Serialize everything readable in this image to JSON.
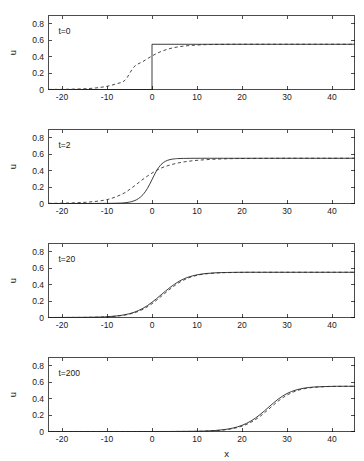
{
  "figure": {
    "width": 364,
    "height": 461,
    "background": "#ffffff",
    "ink_color": "#1b1b1b",
    "xlabel": "x",
    "ylabel": "u"
  },
  "chart_data": {
    "type": "line",
    "title": "",
    "subtitle": "",
    "xlabel": "x",
    "ylabel": "u",
    "grid": false,
    "legend": "none",
    "panel_layout": "4 rows x 1 column, shared x axis",
    "xlim": [
      -23,
      45
    ],
    "ylim": [
      0,
      0.9
    ],
    "xticks": [
      -20,
      -10,
      0,
      10,
      20,
      30,
      40
    ],
    "xticklabels": [
      "-20",
      "-10",
      "0",
      "10",
      "20",
      "30",
      "40"
    ],
    "yticks": [
      0,
      0.2,
      0.4,
      0.6,
      0.8
    ],
    "yticklabels": [
      "0",
      "0.2",
      "0.4",
      "0.6",
      "0.8"
    ],
    "plateau_value": 0.55,
    "series_styles": [
      {
        "name": "solid",
        "linestyle": "solid",
        "color": "#1b1b1b"
      },
      {
        "name": "dashed",
        "linestyle": "dashed",
        "color": "#2a2a2a"
      }
    ],
    "panels": [
      {
        "id": "panel-t0",
        "annotation": "t=0",
        "time": 0,
        "ylabel": "u",
        "series": [
          {
            "name": "solid",
            "description": "Heaviside step: u=0 for x<0, u=0.55 for x>=0",
            "shape": "step",
            "step_x": 0,
            "low": 0,
            "high": 0.55,
            "x": [
              -23,
              -0.001,
              0,
              45
            ],
            "y": [
              0,
              0,
              0.55,
              0.55
            ]
          },
          {
            "name": "dashed",
            "description": "smooth sigmoidal front centered near x=-4",
            "shape": "tanh",
            "center": -4,
            "width": 6.0,
            "amplitude": 0.55,
            "x": [
              -23,
              -20,
              -18,
              -16,
              -14,
              -12,
              -10,
              -8,
              -6,
              -4,
              -2,
              0,
              2,
              4,
              6,
              8,
              10,
              12,
              14,
              16,
              18,
              20,
              24,
              28,
              32,
              36,
              40,
              45
            ],
            "y": [
              0.001,
              0.002,
              0.004,
              0.007,
              0.012,
              0.022,
              0.039,
              0.068,
              0.113,
              0.275,
              0.341,
              0.408,
              0.462,
              0.498,
              0.52,
              0.533,
              0.541,
              0.546,
              0.548,
              0.549,
              0.55,
              0.55,
              0.55,
              0.55,
              0.55,
              0.55,
              0.55,
              0.55
            ]
          }
        ]
      },
      {
        "id": "panel-t2",
        "annotation": "t=2",
        "time": 2,
        "ylabel": "u",
        "series": [
          {
            "name": "solid",
            "description": "steep front centered near x=0",
            "shape": "tanh",
            "center": 0,
            "width": 2.0,
            "amplitude": 0.55,
            "x": [
              -23,
              -16,
              -12,
              -9,
              -7,
              -6,
              -5,
              -4,
              -3,
              -2,
              -1,
              0,
              1,
              2,
              3,
              4,
              5,
              6,
              8,
              10,
              14,
              20,
              30,
              40,
              45
            ],
            "y": [
              0.0,
              0.0,
              0.001,
              0.002,
              0.005,
              0.009,
              0.017,
              0.032,
              0.06,
              0.108,
              0.185,
              0.29,
              0.398,
              0.473,
              0.514,
              0.534,
              0.543,
              0.547,
              0.549,
              0.55,
              0.55,
              0.55,
              0.55,
              0.55,
              0.55
            ]
          },
          {
            "name": "dashed",
            "description": "broader front centered near x=-3 lagging behind",
            "shape": "tanh",
            "center": -3,
            "width": 4.5,
            "amplitude": 0.55,
            "x": [
              -23,
              -20,
              -18,
              -16,
              -14,
              -12,
              -10,
              -8,
              -6,
              -4,
              -2,
              0,
              2,
              4,
              6,
              8,
              10,
              12,
              14,
              16,
              18,
              20,
              25,
              30,
              36,
              40,
              45
            ],
            "y": [
              0.002,
              0.004,
              0.007,
              0.011,
              0.018,
              0.029,
              0.047,
              0.082,
              0.133,
              0.21,
              0.295,
              0.37,
              0.43,
              0.468,
              0.495,
              0.513,
              0.525,
              0.533,
              0.539,
              0.543,
              0.546,
              0.547,
              0.549,
              0.55,
              0.55,
              0.55,
              0.55
            ]
          }
        ]
      },
      {
        "id": "panel-t20",
        "annotation": "t=20",
        "time": 20,
        "ylabel": "u",
        "series": [
          {
            "name": "solid",
            "description": "traveling front centered near x=2.5, curves nearly coincide",
            "shape": "tanh",
            "center": 2.5,
            "width": 4.2,
            "amplitude": 0.55,
            "x": [
              -23,
              -18,
              -15,
              -12,
              -10,
              -8,
              -6,
              -4,
              -2,
              0,
              2,
              4,
              6,
              8,
              10,
              12,
              14,
              16,
              20,
              25,
              30,
              36,
              40,
              45
            ],
            "y": [
              0.0,
              0.001,
              0.002,
              0.005,
              0.009,
              0.018,
              0.034,
              0.063,
              0.112,
              0.185,
              0.275,
              0.365,
              0.44,
              0.49,
              0.519,
              0.535,
              0.543,
              0.547,
              0.55,
              0.55,
              0.55,
              0.55,
              0.55,
              0.55
            ]
          },
          {
            "name": "dashed",
            "description": "nearly identical front, marginally behind the solid curve",
            "shape": "tanh",
            "center": 2.9,
            "width": 4.2,
            "amplitude": 0.55,
            "x": [
              -23,
              -18,
              -15,
              -12,
              -10,
              -8,
              -6,
              -4,
              -2,
              0,
              2,
              4,
              6,
              8,
              10,
              12,
              14,
              16,
              20,
              25,
              30,
              36,
              40,
              45
            ],
            "y": [
              0.0,
              0.001,
              0.002,
              0.004,
              0.008,
              0.016,
              0.03,
              0.056,
              0.1,
              0.168,
              0.255,
              0.345,
              0.424,
              0.479,
              0.513,
              0.531,
              0.54,
              0.545,
              0.549,
              0.55,
              0.55,
              0.55,
              0.55,
              0.55
            ]
          }
        ]
      },
      {
        "id": "panel-t200",
        "annotation": "t=200",
        "time": 200,
        "ylabel": "u",
        "series": [
          {
            "name": "solid",
            "description": "front has traveled right, centered near x=26",
            "shape": "tanh",
            "center": 26,
            "width": 4.2,
            "amplitude": 0.55,
            "x": [
              -23,
              0,
              6,
              10,
              12,
              14,
              16,
              18,
              20,
              22,
              24,
              26,
              28,
              30,
              32,
              34,
              36,
              38,
              40,
              42,
              45
            ],
            "y": [
              0.0,
              0.0,
              0.001,
              0.003,
              0.006,
              0.012,
              0.023,
              0.042,
              0.075,
              0.128,
              0.205,
              0.3,
              0.392,
              0.462,
              0.505,
              0.529,
              0.541,
              0.546,
              0.549,
              0.55,
              0.55
            ]
          },
          {
            "name": "dashed",
            "description": "nearly identical front, slightly behind the solid curve",
            "shape": "tanh",
            "center": 26.6,
            "width": 4.2,
            "amplitude": 0.55,
            "x": [
              -23,
              0,
              6,
              10,
              12,
              14,
              16,
              18,
              20,
              22,
              24,
              26,
              28,
              30,
              32,
              34,
              36,
              38,
              40,
              42,
              45
            ],
            "y": [
              0.0,
              0.0,
              0.001,
              0.002,
              0.005,
              0.01,
              0.019,
              0.036,
              0.065,
              0.113,
              0.183,
              0.275,
              0.368,
              0.443,
              0.493,
              0.522,
              0.537,
              0.544,
              0.548,
              0.549,
              0.55
            ]
          }
        ]
      }
    ]
  }
}
